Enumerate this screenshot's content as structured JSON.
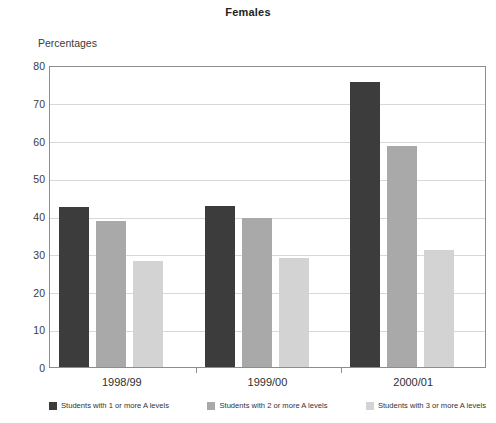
{
  "chart_data": {
    "type": "bar",
    "title": "Females",
    "subtitle": "",
    "xlabel": "",
    "ylabel": "Percentages",
    "ylim": [
      0,
      80
    ],
    "yticks": [
      0,
      10,
      20,
      30,
      40,
      50,
      60,
      70,
      80
    ],
    "grid": true,
    "legend_position": "bottom",
    "categories": [
      "1998/99",
      "1999/00",
      "2000/01"
    ],
    "series": [
      {
        "name": "Students with 1 or more A levels",
        "color": "#3c3c3c",
        "values": [
          42.3,
          42.6,
          75.4
        ]
      },
      {
        "name": "Students with 2 or more A levels",
        "color": "#a9a9a9",
        "values": [
          38.6,
          39.4,
          58.6
        ]
      },
      {
        "name": "Students with 3 or more A levels",
        "color": "#d3d3d3",
        "values": [
          28.0,
          29.0,
          30.9
        ]
      }
    ]
  },
  "axis": {
    "caption": "Percentages"
  },
  "colors": {
    "frame": "#8d8d8d",
    "gridline": "#d8d8d8",
    "text": "#333333",
    "background": "#ffffff"
  }
}
